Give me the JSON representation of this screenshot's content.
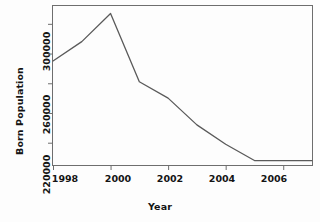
{
  "chart_data": {
    "type": "line",
    "title": "",
    "xlabel": "Year",
    "ylabel": "Born Population",
    "x": [
      1998,
      1999,
      2000,
      2001,
      2002,
      2003,
      2004,
      2005,
      2006,
      2007
    ],
    "values": [
      275000,
      288000,
      307000,
      261000,
      250000,
      232000,
      219000,
      208000,
      208000,
      208000
    ],
    "series": [
      {
        "name": "Born Population",
        "values": [
          275000,
          288000,
          307000,
          261000,
          250000,
          232000,
          219000,
          208000,
          208000,
          208000
        ]
      }
    ],
    "xlim": [
      1998,
      2007
    ],
    "ylim": [
      205000,
      312000
    ],
    "xticks": [
      1998,
      2000,
      2002,
      2004,
      2006
    ],
    "xtick_labels": [
      "1998",
      "2000",
      "2002",
      "2004",
      "2006"
    ],
    "yticks": [
      220000,
      240000,
      260000,
      280000,
      300000
    ],
    "ytick_labels": [
      "220000",
      "",
      "260000",
      "",
      "300000"
    ],
    "ytick_labels_shown": [
      "220000",
      "260000",
      "300000"
    ],
    "grid": false,
    "legend": false,
    "line_color": "#5a5a5a",
    "axis_color": "#6e6e6e",
    "text_color": "#141414",
    "background": "#fdfdfd"
  },
  "annotations": {
    "peak_year": 2000,
    "peak_value": 307000,
    "min_value": 208000
  }
}
